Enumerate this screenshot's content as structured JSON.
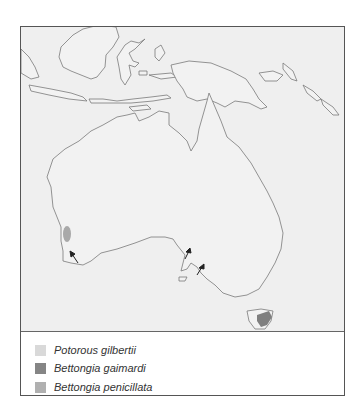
{
  "map": {
    "region": "Australia and surrounding islands",
    "background_color": "#efefef",
    "land_outline_color": "#7a7a7a",
    "ranges": [
      {
        "species": "Bettongia penicillata",
        "location": "south-west Western Australia",
        "color": "#a9a9a9"
      },
      {
        "species": "Bettongia gaimardi",
        "location": "eastern Tasmania",
        "color": "#7f7f7f"
      }
    ],
    "arrow_markers": [
      {
        "location": "south-west coast, Western Australia"
      },
      {
        "location": "South Australia coast (west)"
      },
      {
        "location": "South Australia coast (east)"
      }
    ]
  },
  "legend": {
    "items": [
      {
        "label": "Potorous gilbertii",
        "color": "#d9d9d9"
      },
      {
        "label": "Bettongia gaimardi",
        "color": "#858585"
      },
      {
        "label": "Bettongia penicillata",
        "color": "#b0b0b0"
      }
    ]
  }
}
